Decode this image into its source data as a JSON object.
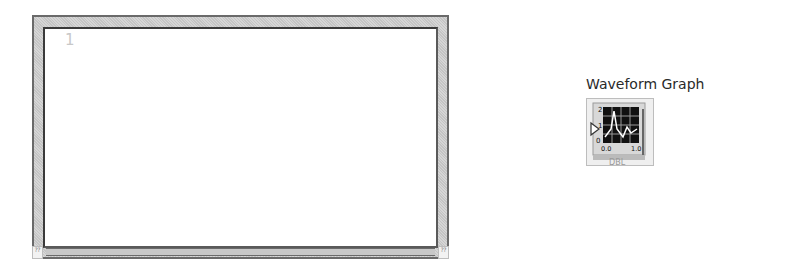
{
  "graph_indicator": {
    "plot_index_label": "1",
    "corner_left_glyph": "⁇",
    "corner_right_glyph": "⁇"
  },
  "terminal": {
    "label": "Waveform Graph",
    "icon": "waveform-graph-icon",
    "data_type": "DBL",
    "icon_axis_labels": [
      "2",
      "1",
      "0",
      "0.0",
      "1.0"
    ]
  }
}
